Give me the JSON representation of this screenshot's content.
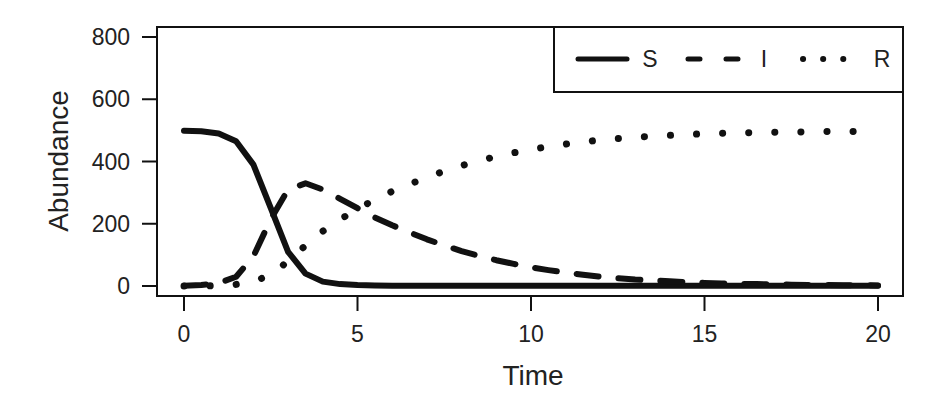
{
  "chart_data": {
    "type": "line",
    "title": "",
    "xlabel": "Time",
    "ylabel": "Abundance",
    "xlim": [
      -0.6,
      20.6
    ],
    "ylim": [
      -30,
      830
    ],
    "x_ticks": [
      0,
      5,
      10,
      15,
      20
    ],
    "y_ticks": [
      0,
      200,
      400,
      600,
      800
    ],
    "grid": false,
    "legend_position": "top-right",
    "x": [
      0,
      0.5,
      1,
      1.5,
      2,
      2.5,
      3,
      3.5,
      4,
      4.5,
      5,
      5.5,
      6,
      6.5,
      7,
      7.5,
      8,
      8.5,
      9,
      9.5,
      10,
      10.5,
      11,
      11.5,
      12,
      12.5,
      13,
      13.5,
      14,
      14.5,
      15,
      15.5,
      16,
      16.5,
      17,
      17.5,
      18,
      18.5,
      19,
      19.5,
      20
    ],
    "series": [
      {
        "name": "S",
        "style": "solid",
        "values": [
          499,
          497,
          490,
          465,
          390,
          250,
          110,
          40,
          14,
          6,
          3,
          2,
          1,
          1,
          1,
          1,
          1,
          1,
          1,
          1,
          1,
          1,
          1,
          1,
          1,
          1,
          1,
          1,
          1,
          1,
          1,
          1,
          1,
          1,
          1,
          1,
          1,
          1,
          1,
          1,
          1
        ]
      },
      {
        "name": "I",
        "style": "dashed",
        "values": [
          1,
          3,
          9,
          30,
          95,
          215,
          310,
          330,
          310,
          280,
          250,
          220,
          195,
          172,
          150,
          130,
          112,
          97,
          83,
          71,
          60,
          51,
          43,
          36,
          30,
          25,
          21,
          18,
          15,
          12,
          10,
          8.5,
          7,
          6,
          5,
          4.2,
          3.6,
          3,
          2.5,
          2.1,
          1.8
        ]
      },
      {
        "name": "R",
        "style": "dotted",
        "values": [
          0,
          0,
          1,
          5,
          15,
          35,
          80,
          130,
          176,
          214,
          247,
          278,
          304,
          327,
          349,
          369,
          387,
          402,
          416,
          428,
          439,
          448,
          456,
          463,
          469,
          474,
          478,
          481,
          484,
          487,
          489,
          490.5,
          492,
          493,
          494,
          494.8,
          495.4,
          496,
          496.5,
          496.9,
          497.2
        ]
      }
    ]
  }
}
